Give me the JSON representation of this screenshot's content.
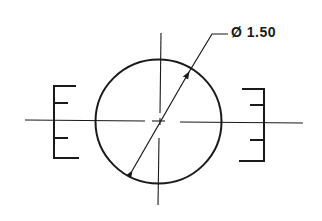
{
  "drawing": {
    "type": "engineering-dimension-drawing",
    "dimension_label": "Ø 1.50",
    "colors": {
      "line": "#1a1a1a",
      "background": "#ffffff"
    },
    "elements": {
      "circle": {
        "cx": 160,
        "cy": 121,
        "r": 63
      },
      "centerlines": [
        "horizontal",
        "vertical"
      ],
      "diameter_leader": {
        "from": [
          130,
          173
        ],
        "to": [
          190,
          69
        ],
        "arrows": "both"
      },
      "left_bracket": "scale-mark-left",
      "right_bracket": "scale-mark-right"
    }
  }
}
